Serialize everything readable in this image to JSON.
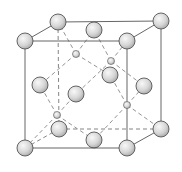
{
  "diagram": {
    "title": "",
    "type": "zinc blende / diamond cubic unit cell",
    "colors": {
      "background": "#ffffff",
      "edge": "#555555",
      "atom_fill_light": "#f4f4f4",
      "atom_fill_dark": "#a8a8a8"
    },
    "cube": {
      "front": {
        "tl": [
          25,
          41
        ],
        "tr": [
          127,
          41
        ],
        "br": [
          127,
          148
        ],
        "bl": [
          25,
          148
        ]
      },
      "back": {
        "tl": [
          58,
          22
        ],
        "tr": [
          161,
          21
        ],
        "br": [
          161,
          129
        ],
        "bl": [
          59,
          129
        ]
      }
    },
    "large_atoms": [
      {
        "name": "corner-front-top-left",
        "x": 25,
        "y": 41
      },
      {
        "name": "corner-front-top-right",
        "x": 127,
        "y": 41
      },
      {
        "name": "corner-front-bottom-left",
        "x": 25,
        "y": 148
      },
      {
        "name": "corner-front-bottom-right",
        "x": 127,
        "y": 148
      },
      {
        "name": "corner-back-top-left",
        "x": 58,
        "y": 22
      },
      {
        "name": "corner-back-top-right",
        "x": 161,
        "y": 21
      },
      {
        "name": "corner-back-bottom-left",
        "x": 59,
        "y": 129
      },
      {
        "name": "corner-back-bottom-right",
        "x": 161,
        "y": 129
      },
      {
        "name": "face-top",
        "x": 94,
        "y": 30
      },
      {
        "name": "face-left",
        "x": 40,
        "y": 85
      },
      {
        "name": "face-front",
        "x": 76,
        "y": 94
      },
      {
        "name": "face-back",
        "x": 110,
        "y": 75
      },
      {
        "name": "face-right",
        "x": 144,
        "y": 86
      },
      {
        "name": "face-bottom",
        "x": 94,
        "y": 140
      }
    ],
    "small_atoms": [
      {
        "name": "tetra-1",
        "x": 76,
        "y": 54,
        "bonds": [
          [
            58,
            22
          ],
          [
            94,
            30
          ],
          [
            40,
            85
          ],
          [
            110,
            75
          ]
        ]
      },
      {
        "name": "tetra-2",
        "x": 111,
        "y": 61,
        "bonds": [
          [
            94,
            30
          ],
          [
            127,
            41
          ],
          [
            76,
            94
          ],
          [
            144,
            86
          ]
        ]
      },
      {
        "name": "tetra-3",
        "x": 57,
        "y": 115,
        "bonds": [
          [
            40,
            85
          ],
          [
            76,
            94
          ],
          [
            25,
            148
          ],
          [
            94,
            140
          ]
        ]
      },
      {
        "name": "tetra-4",
        "x": 127,
        "y": 105,
        "bonds": [
          [
            110,
            75
          ],
          [
            144,
            86
          ],
          [
            161,
            129
          ],
          [
            94,
            140
          ]
        ]
      }
    ],
    "large_radius": 8,
    "small_radius": 3.5
  }
}
